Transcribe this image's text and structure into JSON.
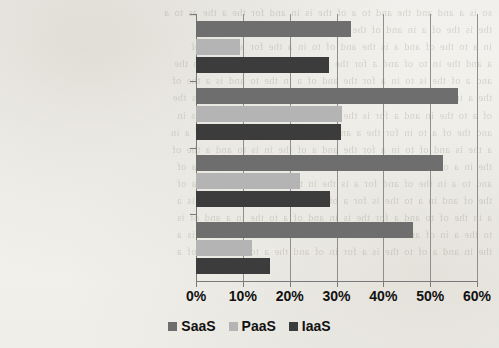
{
  "scan": {
    "bleed_through_note": "faint mirrored text from reverse page (illegible)",
    "bleed_text": "so is a and and the and to a of the is in and for the a the as to a\nthe is the of a in and of the in the the and a for to in and\nin a to the of and a is the and of to in a the for and is a of\na and the in to of and a for the is in and to a the of and in the\nand a of the is to in a for the and of a in the to and is a the of\nthe a in of and to a is the for in and a of the and to in a is the\nof a to the in and a for is the of and in a to the and of a is in\nand the of a to in for the a and is of the in a and to the of a in\na the is and of to in a for the and a of the in is to and a the of\nthe in a of and to is the a for in of and a to the in and is a of\nand to a in the of and for a is the in to and of a the in is a of\nthe of and in a to the is for a of in and the a to in of and is a\na in the of to and a for the is in and of a to the in a and of is\nto the a in of and is the for a in of and to a the in and of is a\nthe in and a of to the is a for in of and the a to in is and of a"
  },
  "chart_data": {
    "type": "bar",
    "orientation": "horizontal",
    "title": "",
    "xlabel": "",
    "ylabel": "",
    "xlim": [
      0,
      60
    ],
    "xtick_values": [
      0,
      10,
      20,
      30,
      40,
      50,
      60
    ],
    "xtick_labels": [
      "0%",
      "10%",
      "20%",
      "30%",
      "40%",
      "50%",
      "60%"
    ],
    "grid": "vertical",
    "legend_position": "bottom",
    "categories": [
      "Corporation",
      "Medium-sized enterprise",
      "Small-sized enterprise",
      "Microenterprise"
    ],
    "series": [
      {
        "name": "SaaS",
        "color": "#6e6e6e",
        "values": [
          33.2,
          56.0,
          52.8,
          46.3
        ]
      },
      {
        "name": "PaaS",
        "color": "#b4b4b4",
        "values": [
          9.5,
          31.2,
          22.1,
          12.0
        ]
      },
      {
        "name": "IaaS",
        "color": "#3c3c3c",
        "values": [
          28.3,
          31.0,
          28.6,
          15.7
        ]
      }
    ]
  }
}
